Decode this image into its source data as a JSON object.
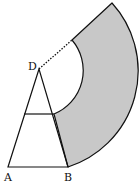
{
  "diagram": {
    "type": "geometry-figure",
    "labels": {
      "apex": "D",
      "left_base": "A",
      "right_base": "B"
    },
    "colors": {
      "shade": "#c8c8c8",
      "stroke": "#111111",
      "background": "#ffffff"
    },
    "points": {
      "D": [
        39,
        69
      ],
      "A": [
        8,
        167
      ],
      "B": [
        68,
        167
      ],
      "crossbar_left": [
        24,
        114
      ],
      "crossbar_right": [
        54,
        114
      ],
      "outer_arc_top": [
        112,
        3
      ],
      "inner_arc_top": [
        72,
        40
      ]
    },
    "radii": {
      "outer": 102,
      "inner": 47
    },
    "dotted_segment": "D to inner_arc_top"
  }
}
